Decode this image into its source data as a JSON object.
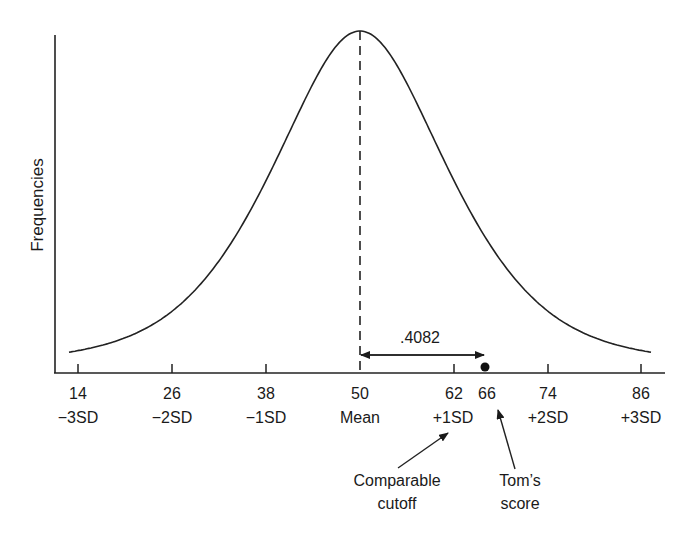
{
  "chart_data": {
    "type": "line",
    "title": "",
    "xlabel": "",
    "ylabel": "Frequencies",
    "mean": 50,
    "sd": 12,
    "ticks": [
      {
        "value": "14",
        "sd_label": "−3SD"
      },
      {
        "value": "26",
        "sd_label": "−2SD"
      },
      {
        "value": "38",
        "sd_label": "−1SD"
      },
      {
        "value": "50",
        "sd_label": "Mean"
      },
      {
        "value": "62",
        "sd_label": "+1SD"
      },
      {
        "value": "74",
        "sd_label": "+2SD"
      },
      {
        "value": "86",
        "sd_label": "+3SD"
      }
    ],
    "extra_tick": "66",
    "xlim": [
      10,
      90
    ],
    "grid": false,
    "annotations": {
      "distance_label": ".4082",
      "cutoff_label_line1": "Comparable",
      "cutoff_label_line2": "cutoff",
      "score_label_line1": "Tom’s",
      "score_label_line2": "score"
    },
    "points": {
      "comparable_cutoff": 62,
      "toms_score": 66
    }
  }
}
